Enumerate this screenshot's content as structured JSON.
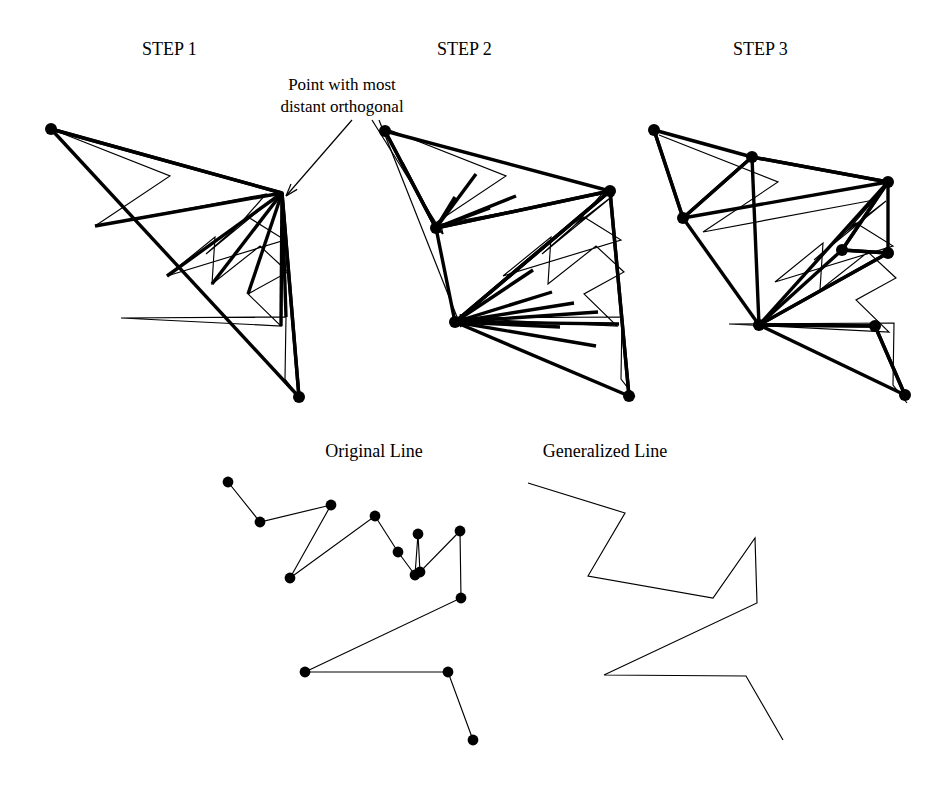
{
  "figure": {
    "title_labels": {
      "step1": "STEP  1",
      "step2": "STEP 2",
      "step3": "STEP 3"
    },
    "annotation": {
      "line1": "Point with most",
      "line2": "distant orthogonal"
    },
    "captions": {
      "original": "Original Line",
      "generalized": "Generalized Line"
    },
    "colors": {
      "ink": "#000000",
      "background": "#ffffff"
    },
    "label_positions": {
      "step1": {
        "x": 142,
        "y": 55
      },
      "step2": {
        "x": 437,
        "y": 55
      },
      "step3": {
        "x": 733,
        "y": 55
      },
      "annotation1": {
        "x": 342,
        "y": 90
      },
      "annotation2": {
        "x": 342,
        "y": 112
      },
      "original": {
        "x": 374,
        "y": 457
      },
      "generalized": {
        "x": 605,
        "y": 457
      }
    },
    "geometry": {
      "original_polyline_top": [
        [
          51,
          129
        ],
        [
          170,
          176
        ],
        [
          95,
          226
        ],
        [
          266,
          194
        ],
        [
          239,
          225
        ],
        [
          278,
          195
        ],
        [
          206,
          254
        ],
        [
          248,
          217
        ],
        [
          285,
          240
        ],
        [
          167,
          276
        ],
        [
          215,
          237
        ],
        [
          212,
          284
        ],
        [
          260,
          246
        ],
        [
          288,
          272
        ],
        [
          248,
          294
        ],
        [
          281,
          326
        ],
        [
          121,
          318
        ],
        [
          286,
          317
        ],
        [
          285,
          379
        ],
        [
          299,
          397
        ]
      ],
      "step1": {
        "anchor_chain": [
          [
            51,
            129
          ],
          [
            282,
            193
          ],
          [
            299,
            397
          ]
        ],
        "spokes_from": [
          282,
          193
        ],
        "spoke_targets": [
          [
            51,
            129
          ],
          [
            95,
            226
          ],
          [
            167,
            276
          ],
          [
            212,
            284
          ],
          [
            248,
            294
          ],
          [
            281,
            326
          ],
          [
            286,
            317
          ],
          [
            299,
            397
          ]
        ],
        "baseline": [
          [
            51,
            129
          ],
          [
            299,
            397
          ]
        ],
        "endpoints": [
          [
            51,
            129
          ],
          [
            299,
            397
          ]
        ],
        "annotated_point": [
          282,
          193
        ]
      },
      "step2": {
        "chain": [
          [
            385,
            131
          ],
          [
            436,
            228
          ],
          [
            455,
            322
          ],
          [
            610,
            191
          ],
          [
            629,
            396
          ]
        ],
        "spokes": [
          {
            "from": [
              436,
              228
            ],
            "to": [
              [
                385,
                131
              ],
              [
                402,
                163
              ],
              [
                455,
                197
              ],
              [
                476,
                174
              ],
              [
                490,
                208
              ],
              [
                516,
                196
              ],
              [
                610,
                191
              ]
            ]
          },
          {
            "from": [
              455,
              322
            ],
            "to": [
              [
                610,
                191
              ],
              [
                533,
                270
              ],
              [
                552,
                292
              ],
              [
                574,
                303
              ],
              [
                598,
                312
              ],
              [
                619,
                324
              ],
              [
                629,
                396
              ],
              [
                596,
                346
              ],
              [
                560,
                327
              ]
            ]
          },
          {
            "from": [
              610,
              191
            ],
            "to": [
              [
                629,
                396
              ],
              [
                455,
                322
              ],
              [
                436,
                228
              ],
              [
                385,
                131
              ]
            ]
          }
        ],
        "annotated_points": [
          [
            436,
            228
          ],
          [
            455,
            322
          ]
        ],
        "vertices": [
          [
            385,
            131
          ],
          [
            436,
            228
          ],
          [
            455,
            322
          ],
          [
            610,
            191
          ],
          [
            629,
            396
          ]
        ]
      },
      "step3": {
        "vertices": [
          [
            654,
            130
          ],
          [
            683,
            218
          ],
          [
            752,
            157
          ],
          [
            888,
            182
          ],
          [
            842,
            250
          ],
          [
            888,
            253
          ],
          [
            759,
            325
          ],
          [
            875,
            326
          ],
          [
            905,
            395
          ]
        ]
      },
      "original_line_bottom": [
        [
          228,
          482
        ],
        [
          260,
          522
        ],
        [
          331,
          505
        ],
        [
          290,
          578
        ],
        [
          375,
          516
        ],
        [
          398,
          552
        ],
        [
          415,
          575
        ],
        [
          418,
          534
        ],
        [
          420,
          572
        ],
        [
          460,
          531
        ],
        [
          461,
          598
        ],
        [
          305,
          672
        ],
        [
          448,
          672
        ],
        [
          473,
          740
        ]
      ],
      "generalized_line_bottom": [
        [
          528,
          483
        ],
        [
          625,
          513
        ],
        [
          588,
          576
        ],
        [
          713,
          598
        ],
        [
          755,
          538
        ],
        [
          757,
          603
        ],
        [
          604,
          675
        ],
        [
          746,
          676
        ],
        [
          783,
          740
        ]
      ],
      "annotation_arrows": [
        {
          "from": [
            352,
            120
          ],
          "to": [
            286,
            196
          ]
        },
        {
          "from": [
            372,
            120
          ],
          "to": [
            443,
            234
          ]
        },
        {
          "from": [
            379,
            120
          ],
          "to": [
            461,
            327
          ]
        }
      ]
    }
  }
}
